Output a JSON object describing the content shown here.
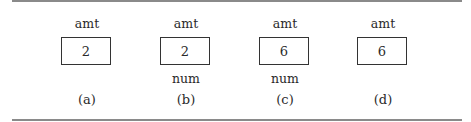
{
  "panels": [
    {
      "variable": "amt",
      "value": "2",
      "alias": "",
      "caption": "(a)"
    },
    {
      "variable": "amt",
      "value": "2",
      "alias": "num",
      "caption": "(b)"
    },
    {
      "variable": "amt",
      "value": "6",
      "alias": "num",
      "caption": "(c)"
    },
    {
      "variable": "amt",
      "value": "6",
      "alias": "",
      "caption": "(d)"
    }
  ]
}
